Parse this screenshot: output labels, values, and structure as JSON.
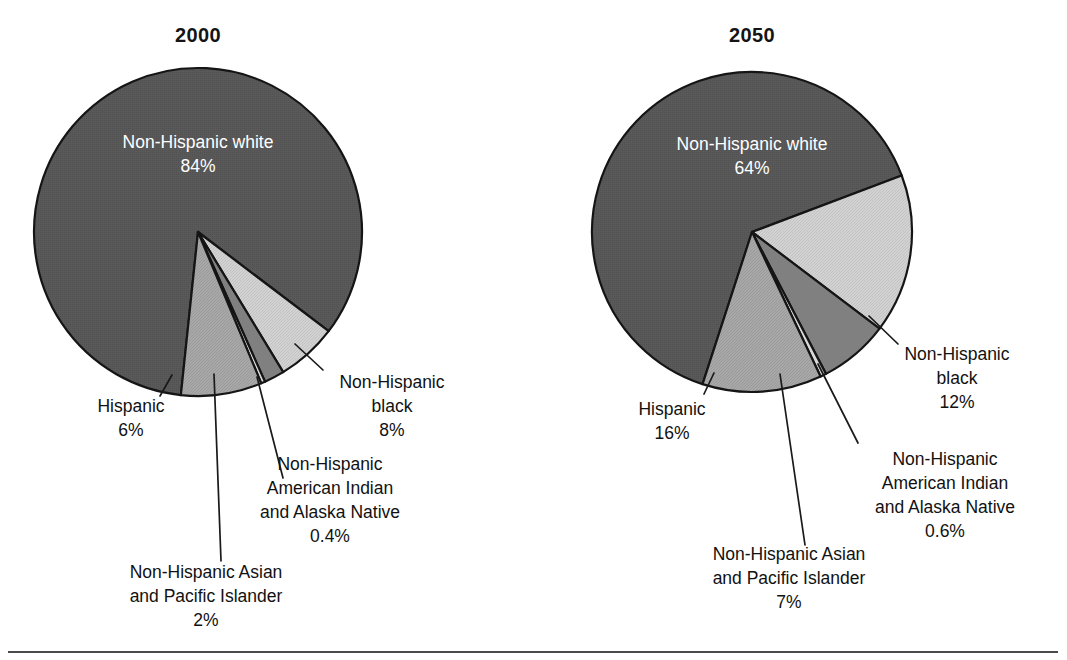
{
  "figure": {
    "background": "#ffffff",
    "rule_color": "#4a4a4a",
    "outline_color": "#151515"
  },
  "palette": {
    "non_hispanic_white": "#595959",
    "hispanic": "#d2d2d2",
    "non_hispanic_asian_pacific_islander": "#808080",
    "non_hispanic_american_indian_alaska_native": "#d8d8d8",
    "non_hispanic_black": "#a8a8a8",
    "label_on_dark": "#ffffff",
    "label_text": "#111111"
  },
  "chart_data": [
    {
      "type": "pie",
      "title": "2000",
      "id": "pie-2000",
      "center": [
        198,
        232
      ],
      "radius": 164,
      "start_angle_deg": 186,
      "direction": "clockwise",
      "categories": [
        "Non-Hispanic white",
        "Hispanic",
        "Non-Hispanic Asian and Pacific Islander",
        "Non-Hispanic American Indian and Alaska Native",
        "Non-Hispanic black"
      ],
      "values": [
        84,
        6,
        2,
        0.4,
        8
      ],
      "value_labels": [
        "84%",
        "6%",
        "2%",
        "0.4%",
        "8%"
      ],
      "colors": [
        "#595959",
        "#d2d2d2",
        "#808080",
        "#d8d8d8",
        "#a8a8a8"
      ],
      "inside_label": {
        "name": "Non-Hispanic white",
        "percent": "84%",
        "x": 198,
        "y": 148
      },
      "callouts": [
        {
          "key": "hispanic",
          "lines": [
            "Hispanic",
            "6%"
          ],
          "align": "middle",
          "text_x": 131,
          "text_y": 412,
          "leader": [
            [
              172,
              375
            ],
            [
              160,
              396
            ]
          ]
        },
        {
          "key": "non-hispanic-asian-and-pacific-islander",
          "lines": [
            "Non-Hispanic Asian",
            "and Pacific Islander",
            "2%"
          ],
          "align": "middle",
          "text_x": 206,
          "text_y": 578,
          "leader": [
            [
              214,
              374
            ],
            [
              221,
              561
            ]
          ]
        },
        {
          "key": "non-hispanic-american-indian-and-alaska-native",
          "lines": [
            "Non-Hispanic",
            "American Indian",
            "and Alaska Native",
            "0.4%"
          ],
          "align": "middle",
          "text_x": 330,
          "text_y": 470,
          "leader": [
            [
              257,
              377
            ],
            [
              283,
              478
            ]
          ]
        },
        {
          "key": "non-hispanic-black",
          "lines": [
            "Non-Hispanic",
            "black",
            "8%"
          ],
          "align": "middle",
          "text_x": 392,
          "text_y": 388,
          "leader": [
            [
              295,
              344
            ],
            [
              323,
              370
            ]
          ]
        }
      ]
    },
    {
      "type": "pie",
      "title": "2050",
      "id": "pie-2050",
      "center": [
        752,
        232
      ],
      "radius": 160,
      "start_angle_deg": 198,
      "direction": "clockwise",
      "categories": [
        "Non-Hispanic white",
        "Hispanic",
        "Non-Hispanic Asian and Pacific Islander",
        "Non-Hispanic American Indian and Alaska Native",
        "Non-Hispanic black"
      ],
      "values": [
        64,
        16,
        7,
        0.6,
        12
      ],
      "value_labels": [
        "64%",
        "16%",
        "7%",
        "0.6%",
        "12%"
      ],
      "colors": [
        "#595959",
        "#d2d2d2",
        "#808080",
        "#d8d8d8",
        "#a8a8a8"
      ],
      "inside_label": {
        "name": "Non-Hispanic white",
        "percent": "64%",
        "x": 752,
        "y": 150
      },
      "callouts": [
        {
          "key": "hispanic",
          "lines": [
            "Hispanic",
            "16%"
          ],
          "align": "middle",
          "text_x": 672,
          "text_y": 415,
          "leader": [
            [
              714,
              373
            ],
            [
              704,
              394
            ]
          ]
        },
        {
          "key": "non-hispanic-asian-and-pacific-islander",
          "lines": [
            "Non-Hispanic Asian",
            "and Pacific Islander",
            "7%"
          ],
          "align": "middle",
          "text_x": 789,
          "text_y": 560,
          "leader": [
            [
              780,
              374
            ],
            [
              805,
              545
            ]
          ]
        },
        {
          "key": "non-hispanic-american-indian-and-alaska-native",
          "lines": [
            "Non-Hispanic",
            "American Indian",
            "and Alaska Native",
            "0.6%"
          ],
          "align": "middle",
          "text_x": 945,
          "text_y": 465,
          "leader": [
            [
              818,
              364
            ],
            [
              858,
              443
            ]
          ]
        },
        {
          "key": "non-hispanic-black",
          "lines": [
            "Non-Hispanic",
            "black",
            "12%"
          ],
          "align": "middle",
          "text_x": 957,
          "text_y": 360,
          "leader": [
            [
              869,
              316
            ],
            [
              898,
              344
            ]
          ]
        }
      ]
    }
  ],
  "bottom_rule": {
    "x1": 8,
    "x2": 1058,
    "y": 652
  }
}
